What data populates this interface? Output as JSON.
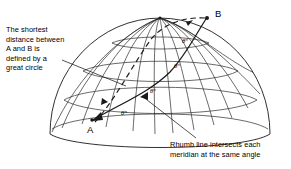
{
  "figure": {
    "title_alt": "Great circle versus rhumb line on a globe",
    "background": "#ffffff",
    "stroke": "#1a1a1a",
    "captions": {
      "great_circle": "The shortest\ndistance between\nA and B is\ndefined by a\ngreat circle",
      "rhumb": "Rhumb line intersects each\nmeridian at the same angle"
    },
    "points": [
      {
        "id": "A",
        "label": "A",
        "x": 92,
        "y": 118
      },
      {
        "id": "B",
        "label": "B",
        "x": 208,
        "y": 16
      }
    ],
    "angle_labels": [
      {
        "text": "θ°",
        "x": 182,
        "y": 38
      },
      {
        "text": "θ°",
        "x": 174,
        "y": 63
      },
      {
        "text": "θ°",
        "x": 150,
        "y": 88
      },
      {
        "text": "θ°",
        "x": 121,
        "y": 110
      }
    ],
    "globe": {
      "center_x": 160,
      "center_y": 134,
      "radius_x": 110,
      "radius_y": 116,
      "meridian_count": 13,
      "parallel_count": 4
    },
    "lines": {
      "great_circle_style": "dashed",
      "rhumb_style": "solid"
    }
  }
}
